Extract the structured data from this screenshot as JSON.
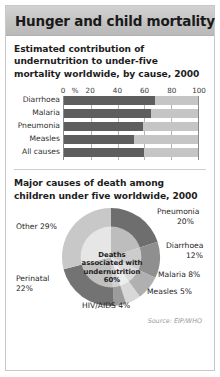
{
  "header": {
    "title": "Hunger and child mortality"
  },
  "section1": {
    "title": "Estimated contribution of undernutrition to under-five mortality worldwide, by cause, 2000"
  },
  "section2": {
    "title": "Major causes of death among children under five worldwide, 2000"
  },
  "source": "Source: EIP/WHO",
  "colors": {
    "bar_dark": "#5e5e5e",
    "bar_light": "#c5c5c5",
    "header_gray": "#c3c3c3",
    "panel_border": "#c9c9c9",
    "axis": "#8a8a8a",
    "gridline": "#b5b5b5",
    "pie_other": "#c8c8c8",
    "pie_pneumonia": "#6e6e6e",
    "pie_diarrhoea": "#8f8f8f",
    "pie_malaria": "#b0b0b0",
    "pie_measles": "#d8d8d8",
    "pie_hivaids": "#9c9c9c",
    "pie_perinatal": "#737373",
    "pie_inner_overlay": "#d0d0d0"
  },
  "chart_data": [
    {
      "type": "bar",
      "title": "Estimated contribution of undernutrition to under-five mortality worldwide, by cause, 2000",
      "orientation": "horizontal",
      "categories": [
        "Diarrhoea",
        "Malaria",
        "Pneumonia",
        "Measles",
        "All causes"
      ],
      "values": [
        68,
        65,
        59,
        52,
        60
      ],
      "xlabel": "%",
      "ylabel": "",
      "xlim": [
        0,
        100
      ],
      "ticks": [
        "0",
        "%",
        "20",
        "40",
        "60",
        "80",
        "100"
      ],
      "tick_values": [
        0,
        9,
        20,
        40,
        60,
        80,
        100
      ],
      "grid": true,
      "legend": "none",
      "series": [
        {
          "name": "Deaths associated with undernutrition",
          "values": [
            68,
            65,
            59,
            52,
            60
          ]
        }
      ]
    },
    {
      "type": "pie",
      "title": "Major causes of death among children under five worldwide, 2000",
      "categories": [
        "Pneumonia",
        "Diarrhoea",
        "Malaria",
        "Measles",
        "HIV/AIDS",
        "Perinatal",
        "Other"
      ],
      "values": [
        20,
        12,
        8,
        5,
        4,
        22,
        29
      ],
      "labels": [
        "Pneumonia 20%",
        "Diarrhoea 12%",
        "Malaria 8%",
        "Measles 5%",
        "HIV/AIDS 4%",
        "Perinatal 22%",
        "Other 29%"
      ],
      "center_annotation": "Deaths associated with undernutrition 60%",
      "legend": "labels-around-pie"
    }
  ],
  "barchart": {
    "ticks": [
      {
        "label": "0",
        "pos": 0
      },
      {
        "label": "%",
        "pos": 9
      },
      {
        "label": "20",
        "pos": 20
      },
      {
        "label": "40",
        "pos": 40
      },
      {
        "label": "60",
        "pos": 60
      },
      {
        "label": "80",
        "pos": 80
      },
      {
        "label": "100",
        "pos": 100
      }
    ],
    "rows": [
      {
        "label": "Diarrhoea",
        "value": 68
      },
      {
        "label": "Malaria",
        "value": 65
      },
      {
        "label": "Pneumonia",
        "value": 59
      },
      {
        "label": "Measles",
        "value": 52
      },
      {
        "label": "All causes",
        "value": 60
      }
    ]
  },
  "pie": {
    "center_text_line1": "Deaths",
    "center_text_line2": "associated with",
    "center_text_line3": "undernutrition",
    "center_text_line4": "60%",
    "labels": {
      "other": "Other 29%",
      "pneumonia_name": "Pneumonia",
      "pneumonia_value": "20%",
      "diarrhoea_name": "Diarrhoea",
      "diarrhoea_value": "12%",
      "malaria": "Malaria 8%",
      "measles": "Measles 5%",
      "hivaids": "HIV/AIDS 4%",
      "perinatal_name": "Perinatal",
      "perinatal_value": "22%"
    }
  }
}
